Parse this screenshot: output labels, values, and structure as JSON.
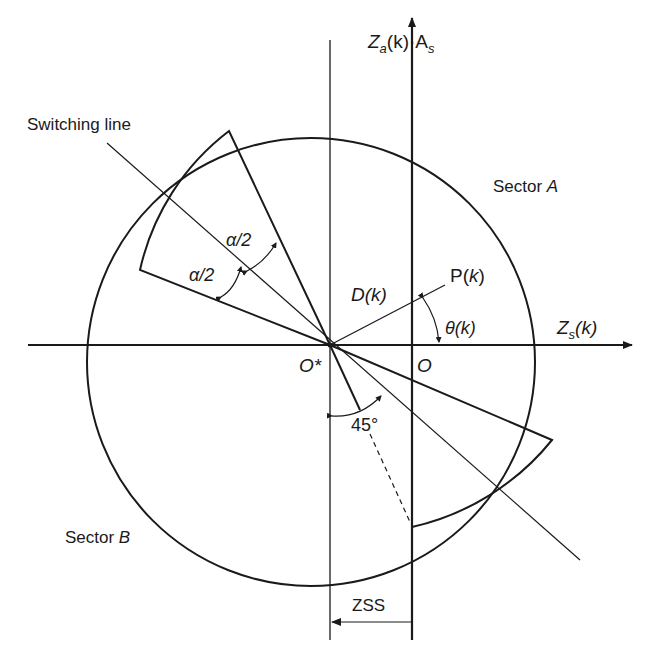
{
  "diagram": {
    "labels": {
      "y_axis": "Z",
      "y_axis_sub": "a",
      "y_axis_rest": "(k)·A",
      "y_axis_sub2": "s",
      "x_axis": "Z",
      "x_axis_sub": "s",
      "x_axis_rest": "(k)",
      "switching_line": "Switching line",
      "sector_a": "Sector ",
      "sector_a_letter": "A",
      "sector_b": "Sector ",
      "sector_b_letter": "B",
      "alpha_upper": "α/2",
      "alpha_lower": "α/2",
      "point": "P(",
      "point_k": "k",
      "point_close": ")",
      "distance": "D(k)",
      "theta": "θ(k)",
      "origin_star": "O*",
      "origin": "O",
      "angle_45": "45°",
      "zss": "ZSS"
    },
    "colors": {
      "stroke": "#1a1a1a",
      "background": "#ffffff"
    }
  }
}
